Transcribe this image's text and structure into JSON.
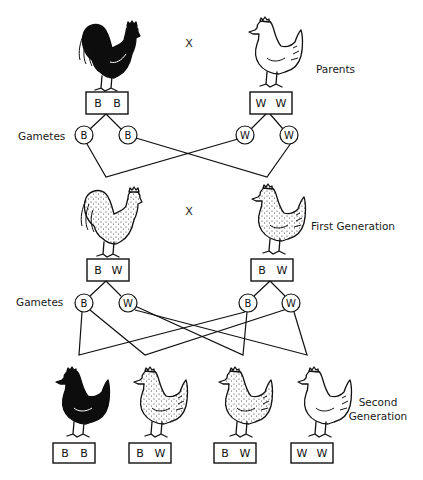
{
  "colors": {
    "black": "#0d0d0d",
    "white": "#ffffff",
    "line": "#111111"
  },
  "labels": {
    "parents": "Parents",
    "first_generation": "First Generation",
    "second_generation_line1": "Second",
    "second_generation_line2": "Generation",
    "gametes_1": "Gametes",
    "gametes_2": "Gametes",
    "cross_1": "X",
    "cross_2": "X"
  },
  "parents": [
    {
      "type": "rooster",
      "plumage": "black",
      "genotype": [
        "B",
        "B"
      ],
      "gametes": [
        "B",
        "B"
      ]
    },
    {
      "type": "hen",
      "plumage": "white",
      "genotype": [
        "W",
        "W"
      ],
      "gametes": [
        "W",
        "W"
      ]
    }
  ],
  "first_generation": [
    {
      "type": "rooster",
      "plumage": "speckled",
      "genotype": [
        "B",
        "W"
      ],
      "gametes": [
        "B",
        "W"
      ]
    },
    {
      "type": "hen",
      "plumage": "speckled",
      "genotype": [
        "B",
        "W"
      ],
      "gametes": [
        "B",
        "W"
      ]
    }
  ],
  "second_generation": [
    {
      "type": "hen",
      "plumage": "black",
      "genotype": [
        "B",
        "B"
      ]
    },
    {
      "type": "hen",
      "plumage": "speckled",
      "genotype": [
        "B",
        "W"
      ]
    },
    {
      "type": "hen",
      "plumage": "speckled",
      "genotype": [
        "B",
        "W"
      ]
    },
    {
      "type": "hen",
      "plumage": "white",
      "genotype": [
        "W",
        "W"
      ]
    }
  ]
}
